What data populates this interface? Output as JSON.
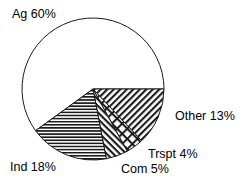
{
  "chart_data": {
    "type": "pie",
    "title": "",
    "subtitle": "",
    "xlabel": "",
    "ylabel": "",
    "grid": false,
    "legend_position": "none",
    "labels_position": "outside",
    "start_angle_deg": 0,
    "direction": "clockwise",
    "center": {
      "x": 93,
      "y": 89
    },
    "radius": 71,
    "categories": [
      "Ag",
      "Other",
      "Trspt",
      "Com",
      "Ind"
    ],
    "values": [
      60,
      13,
      4,
      5,
      18
    ],
    "units": "%",
    "slices": [
      {
        "name": "Ag",
        "label": "Ag 60%",
        "value": 60,
        "pattern": "none",
        "fill": "#ffffff",
        "stroke": "#1a1a1a",
        "start_deg": 144,
        "end_deg": 360
      },
      {
        "name": "Other",
        "label": "Other 13%",
        "value": 13,
        "pattern": "diagonal-forward",
        "fill": "#ffffff",
        "stroke": "#1a1a1a",
        "start_deg": 0,
        "end_deg": 46.8
      },
      {
        "name": "Trspt",
        "label": "Trspt 4%",
        "value": 4,
        "pattern": "crosshatch",
        "fill": "#ffffff",
        "stroke": "#1a1a1a",
        "start_deg": 46.8,
        "end_deg": 61.2
      },
      {
        "name": "Com",
        "label": "Com 5%",
        "value": 5,
        "pattern": "diagonal-back",
        "fill": "#ffffff",
        "stroke": "#1a1a1a",
        "start_deg": 61.2,
        "end_deg": 79.2
      },
      {
        "name": "Ind",
        "label": "Ind 18%",
        "value": 18,
        "pattern": "horizontal",
        "fill": "#ffffff",
        "stroke": "#1a1a1a",
        "start_deg": 79.2,
        "end_deg": 144
      }
    ]
  },
  "labels": {
    "ag": "Ag 60%",
    "other": "Other 13%",
    "trspt": "Trspt 4%",
    "com": "Com 5%",
    "ind": "Ind 18%"
  },
  "colors": {
    "background": "#ffffff",
    "outline": "#1a1a1a",
    "text": "#000000"
  }
}
